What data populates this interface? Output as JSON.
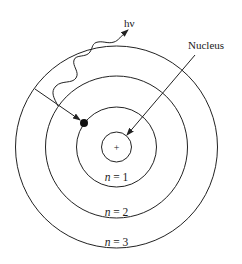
{
  "diagram": {
    "colors": {
      "stroke": "#222222",
      "text": "#1a1a1a",
      "background": "#ffffff"
    },
    "center": {
      "x": 116.5,
      "y": 147
    },
    "nucleus": {
      "radius": 15,
      "symbol": "+",
      "label": "Nucleus"
    },
    "orbits": [
      {
        "n_var": "n",
        "eq": " = 1",
        "radius": 40,
        "label_y": 181
      },
      {
        "n_var": "n",
        "eq": " = 2",
        "radius": 71,
        "label_y": 216
      },
      {
        "n_var": "n",
        "eq": " = 3",
        "radius": 101,
        "label_y": 246
      }
    ],
    "electron": {
      "x": 84,
      "y": 123,
      "radius": 4
    },
    "photon": {
      "label": "hν"
    }
  }
}
